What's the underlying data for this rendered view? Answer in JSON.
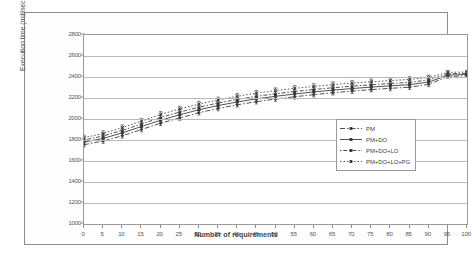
{
  "chart_data": {
    "type": "line",
    "title": "",
    "xlabel": "Number of requirements",
    "ylabel": "Execution time (milliseconds)",
    "xlim": [
      0,
      100
    ],
    "ylim": [
      1000,
      2800
    ],
    "ytick_step": 200,
    "xtick_step": 5,
    "grid": true,
    "legend_position": "center-right",
    "error_bars": true,
    "x": [
      0,
      5,
      10,
      15,
      20,
      25,
      30,
      35,
      40,
      45,
      50,
      55,
      60,
      65,
      70,
      75,
      80,
      85,
      90,
      95,
      100
    ],
    "series": [
      {
        "name": "PM",
        "line_style": "dash-dot",
        "marker": "diamond",
        "values": [
          1755,
          1790,
          1840,
          1900,
          1960,
          2010,
          2060,
          2100,
          2135,
          2165,
          2190,
          2212,
          2232,
          2250,
          2266,
          2280,
          2292,
          2303,
          2330,
          2405,
          2412
        ],
        "errors": [
          22,
          22,
          22,
          22,
          22,
          22,
          22,
          22,
          22,
          22,
          22,
          22,
          22,
          22,
          22,
          22,
          22,
          22,
          22,
          18,
          16
        ]
      },
      {
        "name": "PM+DO",
        "line_style": "solid",
        "marker": "square",
        "values": [
          1780,
          1815,
          1868,
          1928,
          1988,
          2040,
          2088,
          2128,
          2162,
          2192,
          2216,
          2238,
          2258,
          2275,
          2290,
          2304,
          2316,
          2327,
          2352,
          2418,
          2424
        ],
        "errors": [
          24,
          24,
          24,
          24,
          24,
          24,
          24,
          24,
          24,
          24,
          24,
          24,
          24,
          24,
          24,
          24,
          24,
          24,
          22,
          18,
          16
        ]
      },
      {
        "name": "PM+DO+LO",
        "line_style": "dotted-dash",
        "marker": "triangle",
        "values": [
          1800,
          1838,
          1892,
          1952,
          2014,
          2066,
          2112,
          2152,
          2186,
          2216,
          2240,
          2262,
          2281,
          2298,
          2313,
          2326,
          2338,
          2349,
          2372,
          2430,
          2436
        ],
        "errors": [
          24,
          24,
          24,
          24,
          24,
          24,
          24,
          24,
          24,
          24,
          24,
          24,
          24,
          24,
          24,
          24,
          24,
          24,
          22,
          18,
          16
        ]
      },
      {
        "name": "PM+DO+LO+PG",
        "line_style": "dotted",
        "marker": "cross",
        "values": [
          1822,
          1862,
          1918,
          1980,
          2044,
          2096,
          2142,
          2182,
          2216,
          2246,
          2270,
          2292,
          2310,
          2327,
          2342,
          2355,
          2366,
          2377,
          2396,
          2444,
          2448
        ],
        "errors": [
          26,
          26,
          26,
          26,
          26,
          26,
          26,
          26,
          26,
          26,
          26,
          26,
          26,
          26,
          26,
          26,
          26,
          26,
          22,
          18,
          16
        ]
      }
    ],
    "ytick_labels": [
      "1000",
      "1200",
      "1400",
      "1600",
      "1800",
      "2000",
      "2200",
      "2400",
      "2600",
      "2800"
    ],
    "xtick_labels": [
      "0",
      "5",
      "10",
      "15",
      "20",
      "25",
      "30",
      "35",
      "40",
      "45",
      "50",
      "55",
      "60",
      "65",
      "70",
      "75",
      "80",
      "85",
      "90",
      "95",
      "100"
    ]
  },
  "legend": {
    "items": [
      {
        "label": "PM"
      },
      {
        "label": "PM+DO"
      },
      {
        "label": "PM+DO+LO"
      },
      {
        "label": "PM+DO+LO+PG"
      }
    ]
  }
}
